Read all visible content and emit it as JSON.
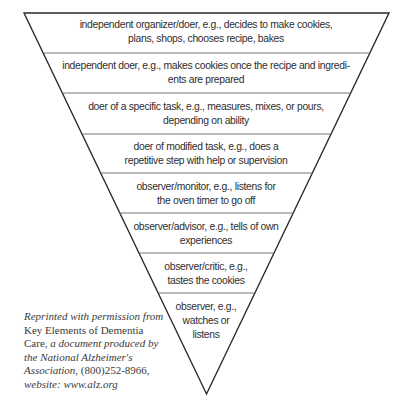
{
  "diagram": {
    "type": "inverted-pyramid",
    "colors": {
      "outline": "#2a2a2a",
      "separator": "#777777",
      "text": "#2e2e2e"
    },
    "levels": [
      {
        "lines": [
          "independent organizer/doer, e.g., decides to make cookies,",
          "plans, shops, chooses recipe, bakes"
        ]
      },
      {
        "lines": [
          "independent doer, e.g., makes cookies once the recipe and ingredi-",
          "ents are prepared"
        ]
      },
      {
        "lines": [
          "doer of a specific task, e.g., measures, mixes, or pours,",
          "depending on ability"
        ]
      },
      {
        "lines": [
          "doer of modified task, e.g., does a",
          "repetitive step with help or supervision"
        ]
      },
      {
        "lines": [
          "observer/monitor, e.g., listens for",
          "the oven timer to go off"
        ]
      },
      {
        "lines": [
          "observer/advisor, e.g., tells of own",
          "experiences"
        ]
      },
      {
        "lines": [
          "observer/critic, e.g.,",
          "tastes the cookies"
        ]
      },
      {
        "lines": [
          "observer, e.g.,",
          "watches or",
          "listens"
        ]
      }
    ]
  },
  "credit": {
    "line1": "Reprinted with permission from",
    "line2": "Key Elements of Dementia",
    "line3_roman": "Care,",
    "line3_italic": " a document produced by",
    "line4": "the National Alzheimer's",
    "line5_italic": "Association,",
    "line5_roman": " (800)252-8966,",
    "line6": "website: www.alz.org"
  }
}
